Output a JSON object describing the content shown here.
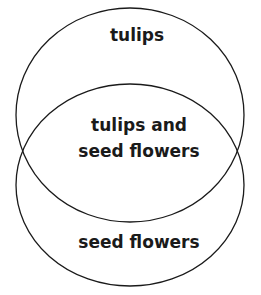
{
  "diagram": {
    "type": "venn",
    "sets": [
      {
        "label": "tulips"
      },
      {
        "label": "seed flowers"
      }
    ],
    "intersection": {
      "line1": "tulips and",
      "line2": "seed flowers"
    }
  },
  "style": {
    "stroke": "#1a1a1a",
    "text": "#1a1a1a"
  }
}
